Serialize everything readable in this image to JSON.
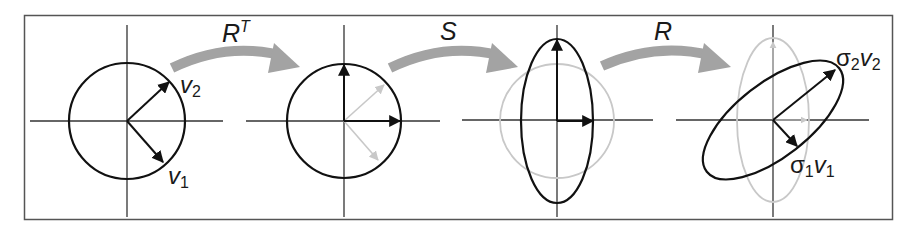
{
  "diagram": {
    "colors": {
      "border": "#555555",
      "axis": "#333333",
      "stroke": "#111111",
      "faded": "#c8c8c8",
      "transform_arrow": "#a3a3a3"
    },
    "transforms": [
      {
        "name": "R",
        "sup": "T"
      },
      {
        "name": "S",
        "sup": ""
      },
      {
        "name": "R",
        "sup": ""
      }
    ],
    "panels": [
      {
        "id": "panel-1",
        "shape": "circle",
        "vectors": [
          {
            "label": "v",
            "sub": "2"
          },
          {
            "label": "v",
            "sub": "1"
          }
        ]
      },
      {
        "id": "panel-2",
        "shape": "circle",
        "vectors": []
      },
      {
        "id": "panel-3",
        "shape": "ellipse-vertical",
        "vectors": []
      },
      {
        "id": "panel-4",
        "shape": "ellipse-rotated",
        "vectors": [
          {
            "label": "σ",
            "sub": "2",
            "label2": "v",
            "sub2": "2"
          },
          {
            "label": "σ",
            "sub": "1",
            "label2": "v",
            "sub2": "1"
          }
        ]
      }
    ]
  }
}
